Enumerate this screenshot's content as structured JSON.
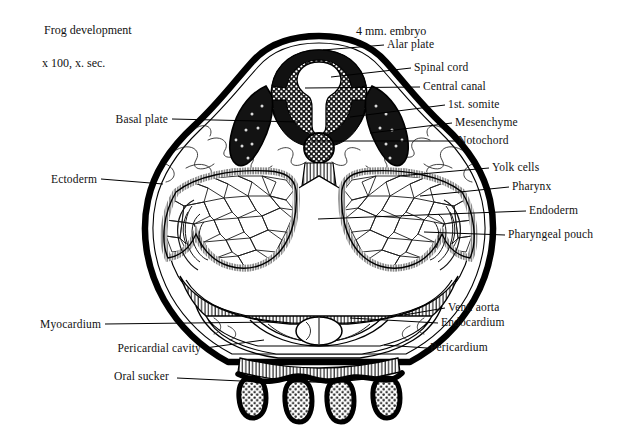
{
  "figure": {
    "title": "Frog development",
    "subtitle": "x 100, x. sec.",
    "specimen": "4 mm. embryo",
    "type": "histological cross-section drawing",
    "background_color": "#ffffff",
    "ink_color": "#000000"
  },
  "labels_left": [
    {
      "text": "Basal plate",
      "x": 168,
      "y": 120,
      "lx1": 172,
      "ly1": 119,
      "lx2": 300,
      "ly2": 122
    },
    {
      "text": "Ectoderm",
      "x": 97,
      "y": 180,
      "lx1": 101,
      "ly1": 179,
      "lx2": 163,
      "ly2": 184
    },
    {
      "text": "Myocardium",
      "x": 101,
      "y": 325,
      "lx1": 105,
      "ly1": 324,
      "lx2": 277,
      "ly2": 322
    },
    {
      "text": "Pericardial cavity",
      "x": 201,
      "y": 349,
      "lx1": 205,
      "ly1": 348,
      "lx2": 264,
      "ly2": 340
    },
    {
      "text": "Oral sucker",
      "x": 169,
      "y": 377,
      "lx1": 177,
      "ly1": 378,
      "lx2": 262,
      "ly2": 382
    }
  ],
  "labels_right": [
    {
      "text": "Alar plate",
      "x": 387,
      "y": 45,
      "lx1": 384,
      "ly1": 45,
      "lx2": 323,
      "ly2": 50
    },
    {
      "text": "Spinal cord",
      "x": 414,
      "y": 68,
      "lx1": 411,
      "ly1": 68,
      "lx2": 331,
      "ly2": 77
    },
    {
      "text": "Central canal",
      "x": 423,
      "y": 87,
      "lx1": 420,
      "ly1": 87,
      "lx2": 305,
      "ly2": 88
    },
    {
      "text": "1st. somite",
      "x": 448,
      "y": 105,
      "lx1": 445,
      "ly1": 105,
      "lx2": 350,
      "ly2": 117
    },
    {
      "text": "Mesenchyme",
      "x": 455,
      "y": 123,
      "lx1": 452,
      "ly1": 123,
      "lx2": 370,
      "ly2": 133
    },
    {
      "text": "Notochord",
      "x": 458,
      "y": 141,
      "lx1": 455,
      "ly1": 141,
      "lx2": 311,
      "ly2": 141
    },
    {
      "text": "Yolk cells",
      "x": 492,
      "y": 168,
      "lx1": 489,
      "ly1": 168,
      "lx2": 398,
      "ly2": 176
    },
    {
      "text": "Pharynx",
      "x": 512,
      "y": 187,
      "lx1": 509,
      "ly1": 187,
      "lx2": 420,
      "ly2": 196
    },
    {
      "text": "Endoderm",
      "x": 529,
      "y": 211,
      "lx1": 526,
      "ly1": 211,
      "lx2": 318,
      "ly2": 219
    },
    {
      "text": "Pharyngeal pouch",
      "x": 508,
      "y": 235,
      "lx1": 505,
      "ly1": 235,
      "lx2": 424,
      "ly2": 232
    },
    {
      "text": "Vent. aorta",
      "x": 448,
      "y": 308,
      "lx1": 445,
      "ly1": 308,
      "lx2": 404,
      "ly2": 315
    },
    {
      "text": "Endocardium",
      "x": 441,
      "y": 323,
      "lx1": 438,
      "ly1": 323,
      "lx2": 350,
      "ly2": 318
    },
    {
      "text": "Pericardium",
      "x": 430,
      "y": 348,
      "lx1": 427,
      "ly1": 348,
      "lx2": 384,
      "ly2": 345
    }
  ],
  "structures": [
    {
      "name": "ectoderm",
      "description": "thick dark outer boundary of the embryo"
    },
    {
      "name": "neural-tube",
      "description": "dorsal spinal cord with keyhole-shaped central canal"
    },
    {
      "name": "central-canal",
      "description": "white keyhole lumen inside the neural tube"
    },
    {
      "name": "alar-plate",
      "description": "dorsal half of the neural tube wall"
    },
    {
      "name": "basal-plate",
      "description": "ventral half of the neural tube wall"
    },
    {
      "name": "somite-left",
      "description": "dark crescent of first somite, left side"
    },
    {
      "name": "somite-right",
      "description": "dark crescent of first somite, right side"
    },
    {
      "name": "notochord",
      "description": "stippled circle beneath the neural tube"
    },
    {
      "name": "mesenchyme",
      "description": "loose wispy tissue filling the dorsolateral spaces"
    },
    {
      "name": "yolk-mass-left",
      "description": "polygonal yolk cells, left wing"
    },
    {
      "name": "yolk-mass-right",
      "description": "polygonal yolk cells, right wing"
    },
    {
      "name": "pharynx-cavity",
      "description": "large central white cavity"
    },
    {
      "name": "endoderm",
      "description": "hatched epithelial lining around the pharynx"
    },
    {
      "name": "pharyngeal-pouch",
      "description": "lateral outpocketing of the pharynx"
    },
    {
      "name": "pericardial-cavity",
      "description": "ventral cavity housing the heart"
    },
    {
      "name": "myocardium",
      "description": "heart muscle wall"
    },
    {
      "name": "endocardium",
      "description": "inner heart lining"
    },
    {
      "name": "pericardium",
      "description": "outer membrane of the pericardial cavity"
    },
    {
      "name": "ventral-aorta",
      "description": "small oval vessel at the ventral midline"
    },
    {
      "name": "oral-sucker",
      "description": "four dark finger-like ventral projections"
    }
  ]
}
